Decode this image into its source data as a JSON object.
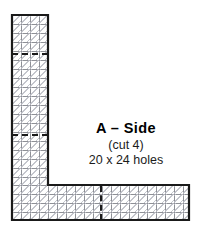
{
  "figure": {
    "kind": "plastic-canvas-cutting-diagram",
    "shape": "L-shape",
    "outline_color": "#1a1a1a",
    "mesh_color": "#8e9096",
    "background_color": "#ffffff",
    "fold_line_color": "#1a1a1a",
    "fold_line_style": "dashed"
  },
  "label": {
    "title": "A – Side",
    "cut_note": "(cut 4)",
    "size_note": "20 x 24 holes"
  },
  "pieces": {
    "vertical_leg": {
      "name": "vertical-leg",
      "holes_wide": 4,
      "holes_tall": 23
    },
    "horizontal_foot": {
      "name": "horizontal-foot",
      "holes_wide": 20,
      "holes_tall": 4
    }
  },
  "guides": [
    {
      "name": "fold-line-upper",
      "orientation": "horizontal"
    },
    {
      "name": "fold-line-lower",
      "orientation": "horizontal"
    },
    {
      "name": "fold-line-foot",
      "orientation": "vertical"
    }
  ]
}
